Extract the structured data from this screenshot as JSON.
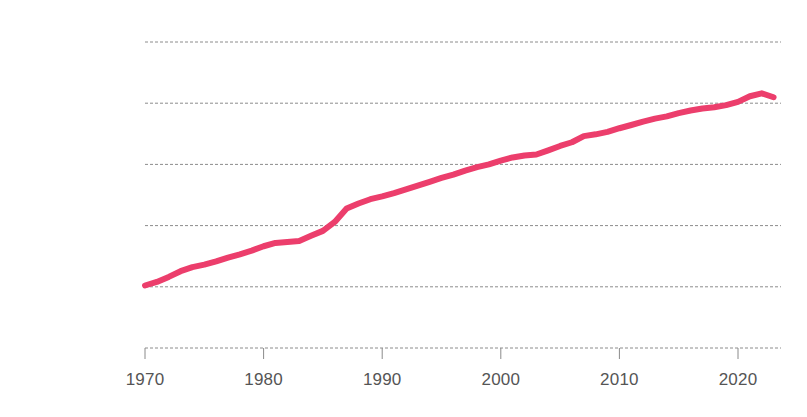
{
  "chart_data": {
    "type": "line",
    "title": "",
    "subtitle": "",
    "xlabel": "",
    "ylabel": "",
    "yscale": "log",
    "xlim": [
      1970,
      2023
    ],
    "ylim": [
      1000,
      100000000
    ],
    "grid": "horizontal-dashed",
    "legend": "none",
    "y_tick_labels": [
      "$100,000,000",
      "$10,000,000",
      "$1,000,000",
      "$100,000",
      "$10,000",
      "$1,000"
    ],
    "y_tick_values": [
      100000000,
      10000000,
      1000000,
      100000,
      10000,
      1000
    ],
    "x_tick_labels": [
      "1970",
      "1980",
      "1990",
      "2000",
      "2010",
      "2020"
    ],
    "x_tick_values": [
      1970,
      1980,
      1990,
      2000,
      2010,
      2020
    ],
    "series": [
      {
        "name": "value",
        "color": "#ec3e6c",
        "line_width": 6,
        "x": [
          1970,
          1971,
          1972,
          1973,
          1974,
          1975,
          1976,
          1977,
          1978,
          1979,
          1980,
          1981,
          1982,
          1983,
          1984,
          1985,
          1986,
          1987,
          1988,
          1989,
          1990,
          1991,
          1992,
          1993,
          1994,
          1995,
          1996,
          1997,
          1998,
          1999,
          2000,
          2001,
          2002,
          2003,
          2004,
          2005,
          2006,
          2007,
          2008,
          2009,
          2010,
          2011,
          2012,
          2013,
          2014,
          2015,
          2016,
          2017,
          2018,
          2019,
          2020,
          2021,
          2022,
          2023
        ],
        "values": [
          10500,
          12000,
          14500,
          18000,
          21000,
          23000,
          26000,
          30000,
          34000,
          39000,
          46000,
          52000,
          54000,
          56000,
          68000,
          82000,
          115000,
          190000,
          230000,
          270000,
          300000,
          340000,
          390000,
          450000,
          520000,
          600000,
          680000,
          790000,
          900000,
          1000000,
          1150000,
          1300000,
          1400000,
          1450000,
          1700000,
          2000000,
          2300000,
          2900000,
          3100000,
          3400000,
          3900000,
          4400000,
          5000000,
          5600000,
          6100000,
          6900000,
          7600000,
          8200000,
          8600000,
          9300000,
          10500000,
          13000000,
          14500000,
          12500000
        ]
      }
    ]
  },
  "axis": {
    "tick_color": "#8a8a8a",
    "grid_color": "#8c8c8c",
    "label_color": "#555555"
  }
}
